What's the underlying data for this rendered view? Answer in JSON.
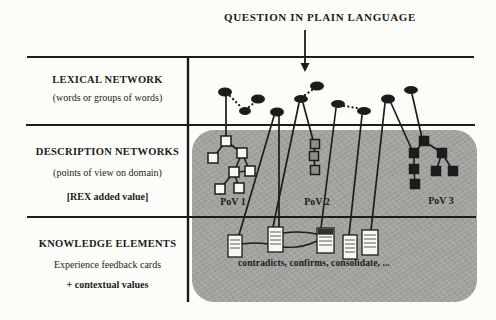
{
  "title": "QUESTION IN PLAIN LANGUAGE",
  "left_column": {
    "rows": [
      {
        "heading": "LEXICAL NETWORK",
        "lines": [
          "(words or groups of words)"
        ]
      },
      {
        "heading": "DESCRIPTION NETWORKS",
        "lines": [
          "(points of view on domain)",
          "[REX added value]"
        ]
      },
      {
        "heading": "KNOWLEDGE ELEMENTS",
        "lines": [
          "Experience feedback cards",
          "+ contextual values"
        ]
      }
    ]
  },
  "panel": {
    "pov_labels": [
      "PoV 1",
      "PoV 2",
      "PoV 3"
    ],
    "caption": "contradicts, confirms, consolidate, ..."
  },
  "colors": {
    "paper": "#fcfcf9",
    "ink": "#1c1c1c",
    "panel_gray": "#a3a39f",
    "white_node": "#f8f8f3",
    "gray_node": "#8e8e88",
    "black_node": "#1d1d1d",
    "card_face": "#f7f7f2",
    "card_line": "#6a6a66",
    "card_header": "#2e2e2c"
  },
  "figure": {
    "grid": {
      "h": [
        [
          27,
          57,
          474
        ],
        [
          26,
          125,
          475
        ],
        [
          27,
          217,
          476
        ]
      ],
      "v": [
        [
          188,
          57,
          302
        ]
      ]
    },
    "arrow": {
      "x": 305,
      "y1": 30,
      "y2": 64,
      "tip": 72,
      "half": 4.5
    },
    "ellipses": [
      [
        225,
        92,
        7,
        4.5
      ],
      [
        245,
        111,
        6,
        4
      ],
      [
        258,
        99,
        7,
        4.5
      ],
      [
        277,
        112,
        7,
        4.5
      ],
      [
        301,
        99,
        7,
        4
      ],
      [
        317,
        86,
        7,
        4.5
      ],
      [
        338,
        104,
        7,
        4
      ],
      [
        364,
        111,
        7,
        4
      ],
      [
        388,
        99,
        7,
        4.5
      ],
      [
        411,
        90,
        7,
        4
      ]
    ],
    "dotted_links": [
      [
        230,
        96,
        241,
        107
      ],
      [
        249,
        107,
        254,
        103
      ],
      [
        305,
        95,
        312,
        90
      ],
      [
        344,
        106,
        357,
        108
      ]
    ],
    "solid_links": [
      [
        226,
        96,
        226,
        137
      ],
      [
        274,
        116,
        239,
        235
      ],
      [
        279,
        116,
        279,
        227
      ],
      [
        299,
        103,
        273,
        227
      ],
      [
        303,
        103,
        313,
        140
      ],
      [
        336,
        108,
        321,
        228
      ],
      [
        362,
        115,
        349,
        235
      ],
      [
        385,
        103,
        371,
        230
      ],
      [
        391,
        103,
        412,
        150
      ],
      [
        412,
        94,
        422,
        138
      ]
    ],
    "trees": [
      {
        "name": "pov1",
        "style": "white",
        "size": 10,
        "nodes": [
          [
            226,
            141
          ],
          [
            213,
            158
          ],
          [
            242,
            153
          ],
          [
            234,
            172
          ],
          [
            250,
            171
          ],
          [
            220,
            189
          ],
          [
            239,
            188
          ]
        ],
        "edges": [
          [
            0,
            1
          ],
          [
            0,
            2
          ],
          [
            2,
            3
          ],
          [
            2,
            4
          ],
          [
            3,
            4
          ],
          [
            3,
            5
          ],
          [
            3,
            6
          ]
        ]
      },
      {
        "name": "pov2",
        "style": "gray",
        "size": 9,
        "nodes": [
          [
            315,
            144
          ],
          [
            314,
            156
          ],
          [
            315,
            170
          ]
        ],
        "edges": [
          [
            0,
            1
          ],
          [
            1,
            2
          ]
        ]
      },
      {
        "name": "pov3",
        "style": "black",
        "size": 9,
        "nodes": [
          [
            424,
            141
          ],
          [
            414,
            153
          ],
          [
            442,
            153
          ],
          [
            414,
            169
          ],
          [
            436,
            171
          ],
          [
            453,
            171
          ],
          [
            415,
            184
          ]
        ],
        "edges": [
          [
            0,
            1
          ],
          [
            0,
            2
          ],
          [
            1,
            3
          ],
          [
            3,
            6
          ],
          [
            2,
            4
          ],
          [
            2,
            5
          ]
        ]
      }
    ],
    "cards": [
      {
        "x": 228,
        "y": 235,
        "w": 14,
        "h": 22,
        "dark": false
      },
      {
        "x": 268,
        "y": 227,
        "w": 15,
        "h": 25,
        "dark": false
      },
      {
        "x": 317,
        "y": 228,
        "w": 17,
        "h": 25,
        "dark": true
      },
      {
        "x": 343,
        "y": 235,
        "w": 14,
        "h": 24,
        "dark": false
      },
      {
        "x": 362,
        "y": 230,
        "w": 16,
        "h": 25,
        "dark": false
      }
    ],
    "card_links": [
      {
        "x1": 242,
        "y1": 244,
        "x2": 268,
        "y2": 244,
        "bow": -2
      },
      {
        "x1": 283,
        "y1": 233,
        "x2": 317,
        "y2": 234,
        "bow": -3
      },
      {
        "x1": 283,
        "y1": 247,
        "x2": 317,
        "y2": 241,
        "bow": 5
      }
    ]
  }
}
